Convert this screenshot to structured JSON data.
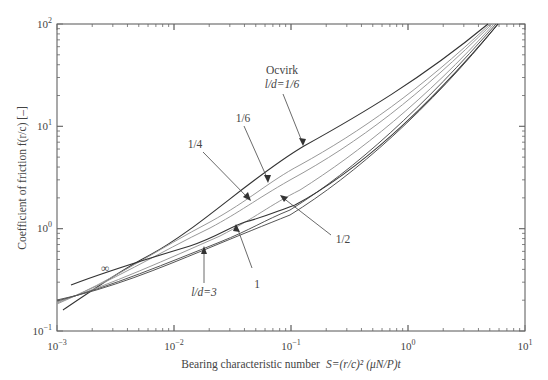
{
  "chart_data": {
    "type": "line",
    "title": "",
    "xlabel": "Bearing characteristic number  S=(r/c)² (μN/P)t",
    "ylabel": "Coefficient of friction f(r/c) [–]",
    "xscale": "log",
    "yscale": "log",
    "xlim": [
      0.001,
      10
    ],
    "ylim": [
      0.1,
      100
    ],
    "x_ticks": [
      "10⁻³",
      "10⁻²",
      "10⁻¹",
      "10⁰",
      "10¹"
    ],
    "y_ticks": [
      "10⁻¹",
      "10⁰",
      "10¹",
      "10²"
    ],
    "grid": false,
    "legend": null,
    "series": [
      {
        "name": "Ocvirk l/d=1/6",
        "x": [
          0.00113,
          0.0062,
          0.03,
          0.129,
          0.5,
          1.5,
          4.8
        ],
        "y": [
          0.16,
          0.55,
          2.0,
          6.3,
          17,
          40,
          100
        ]
      },
      {
        "name": "l/d=1/6",
        "x": [
          0.001,
          0.006,
          0.03,
          0.1,
          0.5,
          1.5,
          5.0
        ],
        "y": [
          0.18,
          0.5,
          1.6,
          4.2,
          13,
          34,
          100
        ]
      },
      {
        "name": "l/d=1/4",
        "x": [
          0.001,
          0.006,
          0.03,
          0.1,
          0.5,
          1.5,
          5.2
        ],
        "y": [
          0.18,
          0.48,
          1.4,
          3.6,
          12,
          32,
          100
        ]
      },
      {
        "name": "l/d=1/2",
        "x": [
          0.001,
          0.006,
          0.03,
          0.1,
          0.5,
          1.5,
          5.4
        ],
        "y": [
          0.18,
          0.46,
          1.2,
          3.0,
          10.5,
          30,
          100
        ]
      },
      {
        "name": "l/d=1",
        "x": [
          0.001,
          0.006,
          0.03,
          0.1,
          0.5,
          1.5,
          5.5
        ],
        "y": [
          0.19,
          0.45,
          1.05,
          2.6,
          9.8,
          29,
          100
        ]
      },
      {
        "name": "l/d=3",
        "x": [
          0.001,
          0.006,
          0.03,
          0.1,
          0.5,
          1.5,
          5.6
        ],
        "y": [
          0.19,
          0.44,
          0.95,
          2.4,
          9.3,
          28,
          100
        ]
      },
      {
        "name": "l/d=∞",
        "x": [
          0.0013,
          0.006,
          0.03,
          0.1,
          0.5,
          1.5,
          5.6
        ],
        "y": [
          0.28,
          0.52,
          1.0,
          2.4,
          9.2,
          28,
          100
        ]
      }
    ],
    "annotations": [
      {
        "text": "Ocvirk",
        "x_px": 282,
        "y_px": 72
      },
      {
        "text": "l/d=1/6",
        "x_px": 282,
        "y_px": 86,
        "target": "Ocvirk curve"
      },
      {
        "text": "1/6",
        "x_px": 243,
        "y_px": 118
      },
      {
        "text": "1/4",
        "x_px": 195,
        "y_px": 144
      },
      {
        "text": "1/2",
        "x_px": 336,
        "y_px": 239
      },
      {
        "text": "1",
        "x_px": 257,
        "y_px": 283
      },
      {
        "text": "l/d=3",
        "x_px": 201,
        "y_px": 292
      },
      {
        "text": "∞",
        "x_px": 104,
        "y_px": 268
      }
    ]
  },
  "axes": {
    "xlabel_main": "Bearing characteristic number",
    "xlabel_formula": "S=(r/c)² (μN/P)t",
    "ylabel": "Coefficient of friction f(r/c) [–]",
    "x_tick_labels": [
      {
        "base": "10",
        "exp": "−3"
      },
      {
        "base": "10",
        "exp": "−2"
      },
      {
        "base": "10",
        "exp": "−1"
      },
      {
        "base": "10",
        "exp": "0"
      },
      {
        "base": "10",
        "exp": "1"
      }
    ],
    "y_tick_labels": [
      {
        "base": "10",
        "exp": "−1"
      },
      {
        "base": "10",
        "exp": "0"
      },
      {
        "base": "10",
        "exp": "1"
      },
      {
        "base": "10",
        "exp": "2"
      }
    ]
  },
  "labels": {
    "ocvirk": "Ocvirk",
    "ocvirk_ld": "l/d=1/6",
    "one_sixth": "1/6",
    "one_quarter": "1/4",
    "one_half": "1/2",
    "one": "1",
    "ld_three": "l/d=3",
    "infinity": "∞"
  }
}
